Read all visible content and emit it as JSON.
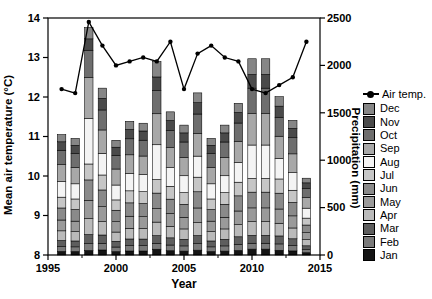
{
  "chart_data": {
    "type": "combo: stacked monthly precipitation bars + annual mean air temperature line",
    "x_axis": {
      "label": "Year",
      "range": [
        1995,
        2015
      ],
      "major_ticks": [
        1995,
        2000,
        2005,
        2010,
        2015
      ],
      "minor_ticks": [
        1997.5,
        2002.5,
        2007.5,
        2012.5
      ]
    },
    "left_axis": {
      "label": "Mean air temperature (°C)",
      "range": [
        8,
        14
      ],
      "ticks": [
        8,
        9,
        10,
        11,
        12,
        13,
        14
      ]
    },
    "right_axis": {
      "label": "Precipitation (mm)",
      "range": [
        0,
        2500
      ],
      "ticks": [
        0,
        500,
        1000,
        1500,
        2000,
        2500
      ]
    },
    "years": [
      1996,
      1997,
      1998,
      1999,
      2000,
      2001,
      2002,
      2003,
      2004,
      2005,
      2006,
      2007,
      2008,
      2009,
      2010,
      2011,
      2012,
      2013,
      2014
    ],
    "air_temp_c": [
      12.2,
      12.1,
      13.9,
      13.3,
      12.8,
      12.9,
      13.0,
      12.9,
      13.4,
      12.2,
      13.1,
      13.3,
      13.0,
      12.9,
      12.2,
      12.1,
      12.3,
      12.5,
      13.4
    ],
    "precip_total_mm": [
      1270,
      1230,
      2400,
      1760,
      1210,
      1410,
      1390,
      2040,
      1510,
      1370,
      1710,
      1230,
      1370,
      1600,
      2070,
      2070,
      1670,
      1420,
      810
    ],
    "months_order": [
      "Jan",
      "Feb",
      "Mar",
      "Apr",
      "May",
      "Jun",
      "Jul",
      "Aug",
      "Sep",
      "Oct",
      "Nov",
      "Dec"
    ],
    "precip_monthly_mm": [
      [
        38,
        51,
        64,
        102,
        114,
        127,
        114,
        165,
        178,
        152,
        89,
        76
      ],
      [
        37,
        49,
        62,
        98,
        111,
        123,
        111,
        160,
        172,
        148,
        86,
        73
      ],
      [
        48,
        72,
        96,
        168,
        192,
        216,
        168,
        480,
        432,
        288,
        120,
        120
      ],
      [
        53,
        70,
        88,
        141,
        158,
        176,
        158,
        229,
        246,
        211,
        123,
        107
      ],
      [
        36,
        48,
        61,
        97,
        109,
        121,
        109,
        157,
        169,
        145,
        85,
        73
      ],
      [
        42,
        56,
        71,
        113,
        127,
        141,
        127,
        183,
        197,
        169,
        99,
        85
      ],
      [
        42,
        56,
        70,
        111,
        125,
        139,
        125,
        181,
        195,
        167,
        97,
        82
      ],
      [
        61,
        61,
        82,
        143,
        143,
        163,
        143,
        367,
        327,
        245,
        143,
        162
      ],
      [
        45,
        60,
        76,
        121,
        136,
        151,
        136,
        196,
        211,
        181,
        106,
        91
      ],
      [
        41,
        55,
        69,
        110,
        123,
        137,
        123,
        178,
        192,
        164,
        96,
        82
      ],
      [
        51,
        68,
        86,
        137,
        154,
        171,
        154,
        222,
        239,
        205,
        120,
        103
      ],
      [
        37,
        49,
        62,
        98,
        111,
        123,
        111,
        160,
        172,
        148,
        86,
        73
      ],
      [
        41,
        55,
        69,
        110,
        123,
        137,
        123,
        178,
        192,
        164,
        96,
        82
      ],
      [
        48,
        64,
        80,
        128,
        144,
        160,
        144,
        208,
        224,
        192,
        112,
        96
      ],
      [
        62,
        62,
        83,
        145,
        145,
        166,
        145,
        352,
        331,
        269,
        145,
        165
      ],
      [
        62,
        62,
        83,
        145,
        145,
        166,
        145,
        352,
        331,
        269,
        145,
        165
      ],
      [
        50,
        67,
        84,
        134,
        150,
        167,
        150,
        217,
        234,
        200,
        117,
        100
      ],
      [
        43,
        57,
        71,
        114,
        128,
        142,
        128,
        185,
        199,
        170,
        99,
        84
      ],
      [
        24,
        32,
        41,
        65,
        73,
        81,
        73,
        105,
        113,
        97,
        57,
        49
      ]
    ],
    "line_color": "#000000",
    "legend": {
      "line_label": "Air temp.",
      "order": [
        "Dec",
        "Nov",
        "Oct",
        "Sep",
        "Aug",
        "Jul",
        "Jun",
        "May",
        "Apr",
        "Mar",
        "Feb",
        "Jan"
      ],
      "month_colors": {
        "Jan": "#141414",
        "Feb": "#7a7a7a",
        "Mar": "#5e5e5e",
        "Apr": "#bababa",
        "May": "#9a9a9a",
        "Jun": "#8a8a8a",
        "Jul": "#c6c6c6",
        "Aug": "#f4f4f4",
        "Sep": "#a8a8a8",
        "Oct": "#6e6e6e",
        "Nov": "#4a4a4a",
        "Dec": "#868686"
      }
    }
  }
}
